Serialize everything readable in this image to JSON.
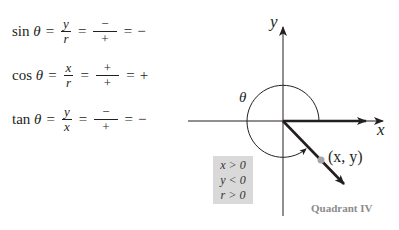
{
  "equations": [
    {
      "fn": "sin",
      "var": "θ",
      "eq1": "=",
      "frac1_num": "y",
      "frac1_den": "r",
      "eq2": "=",
      "frac2_num": "−",
      "frac2_den": "+",
      "eq3": "=",
      "result": "−"
    },
    {
      "fn": "cos",
      "var": "θ",
      "eq1": "=",
      "frac1_num": "x",
      "frac1_den": "r",
      "eq2": "=",
      "frac2_num": "+",
      "frac2_den": "+",
      "eq3": "=",
      "result": "+"
    },
    {
      "fn": "tan",
      "var": "θ",
      "eq1": "=",
      "frac1_num": "y",
      "frac1_den": "x",
      "eq2": "=",
      "frac2_num": "−",
      "frac2_den": "+",
      "eq3": "=",
      "result": "−"
    }
  ],
  "diagram": {
    "y_axis_label": "y",
    "x_axis_label": "x",
    "angle_label": "θ",
    "point_label": "(x, y)",
    "conditions": [
      "x > 0",
      "y < 0",
      "r > 0"
    ],
    "quadrant_label": "Quadrant IV",
    "colors": {
      "line": "#231f20",
      "box": "#d9d9d9",
      "point": "#a6a6a6",
      "quadrant_text": "#8c8c8c"
    }
  }
}
